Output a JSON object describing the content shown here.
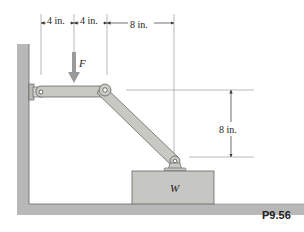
{
  "figure": {
    "label": "P9.56",
    "force_label": "F",
    "weight_label": "W",
    "dimensions": {
      "top_1": "4 in.",
      "top_2": "4 in.",
      "top_3": "8 in.",
      "vertical": "8 in."
    }
  },
  "colors": {
    "member_fill": "#c9c9c4",
    "member_stroke": "#555555",
    "wall_fill": "#b5b5b5",
    "block_fill": "#c6c6c2",
    "dim_line": "#777777"
  }
}
